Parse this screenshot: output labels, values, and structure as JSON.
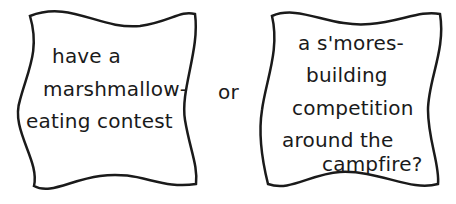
{
  "left_card": {
    "lines": [
      "have a",
      "marshmallow-",
      "eating contest"
    ]
  },
  "connector": {
    "label": "or"
  },
  "right_card": {
    "lines": [
      "a s'mores-",
      "building",
      "competition",
      "around the",
      "campfire?"
    ]
  },
  "colors": {
    "stroke": "#1a1a1a",
    "background": "#ffffff"
  }
}
